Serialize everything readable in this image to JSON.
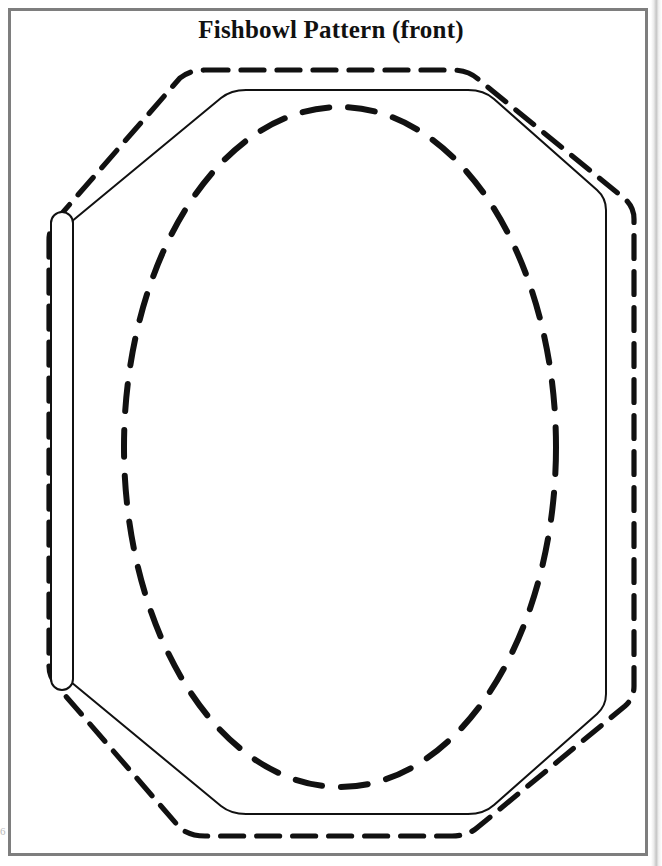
{
  "document": {
    "title": "Fishbowl Pattern (front)",
    "page_background": "#ffffff",
    "frame_color": "#7e7e7e",
    "ink_color": "#111111",
    "margin_mark": "6"
  },
  "pattern": {
    "name": "fishbowl-pattern-front",
    "description": "Craft template: outer dashed cutting octagon, inner solid fold octagon, dashed oval window, and a narrow rounded fold tab on the left side.",
    "layers": [
      {
        "name": "outer-cut-line",
        "style": "dashed",
        "stroke_width": 5,
        "dash": "22 13",
        "color": "#111111",
        "shape": "rounded-octagon",
        "points": "200,70 455,70 633,215 633,690 455,838 200,838 50,690 50,215"
      },
      {
        "name": "inner-fold-line",
        "style": "solid",
        "stroke_width": 2,
        "color": "#111111",
        "shape": "rounded-octagon",
        "points": "240,90 470,90 606,218 606,688 470,816 240,816 70,690 70,214"
      },
      {
        "name": "window-oval",
        "style": "dashed",
        "stroke_width": 6,
        "dash": "26 18",
        "color": "#111111",
        "shape": "ellipse",
        "cx": 340,
        "cy": 447,
        "rx": 216,
        "ry": 340
      },
      {
        "name": "left-fold-tab",
        "style": "solid",
        "stroke_width": 2,
        "color": "#111111",
        "shape": "rounded-rect",
        "x": 51,
        "y": 212,
        "width": 22,
        "height": 478,
        "radius": 11
      }
    ]
  }
}
